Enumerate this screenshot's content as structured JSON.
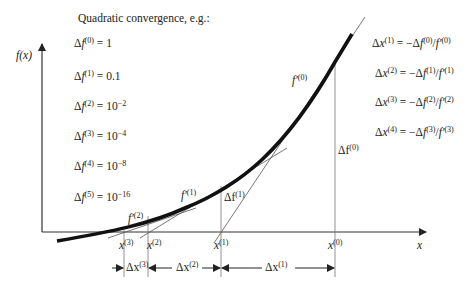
{
  "title": "Quadratic convergence, e.g.:",
  "axes": {
    "y_label": "f(x)",
    "x_label": "x"
  },
  "delta_f_values": [
    {
      "sup": "(0)",
      "value": "1"
    },
    {
      "sup": "(1)",
      "value": "0.1"
    },
    {
      "sup": "(2)",
      "value": "10",
      "exp": "−2"
    },
    {
      "sup": "(3)",
      "value": "10",
      "exp": "−4"
    },
    {
      "sup": "(4)",
      "value": "10",
      "exp": "−8"
    },
    {
      "sup": "(5)",
      "value": "10",
      "exp": "−16"
    }
  ],
  "update_formulas": [
    {
      "lhs_sup": "(1)",
      "f_sup": "(0)",
      "fp_sup": "(0)"
    },
    {
      "lhs_sup": "(2)",
      "f_sup": "(1)",
      "fp_sup": "(1)"
    },
    {
      "lhs_sup": "(3)",
      "f_sup": "(2)",
      "fp_sup": "(2)"
    },
    {
      "lhs_sup": "(4)",
      "f_sup": "(3)",
      "fp_sup": "(3)"
    }
  ],
  "iterates": [
    {
      "label": "x",
      "sup": "(0)",
      "px": 335
    },
    {
      "label": "x",
      "sup": "(1)",
      "px": 221
    },
    {
      "label": "x",
      "sup": "(2)",
      "px": 148
    },
    {
      "label": "x",
      "sup": "(3)",
      "px": 124
    }
  ],
  "derivative_labels": [
    {
      "label": "f′",
      "sup": "(0)"
    },
    {
      "label": "f′",
      "sup": "(1)"
    },
    {
      "label": "f′",
      "sup": "(2)"
    }
  ],
  "delta_f_plot_labels": [
    {
      "label": "Δf",
      "sup": "(0)"
    },
    {
      "label": "Δf",
      "sup": "(1)"
    }
  ],
  "delta_x_labels": [
    {
      "label": "Δx",
      "sup": "(1)"
    },
    {
      "label": "Δx",
      "sup": "(2)"
    },
    {
      "label": "Δx",
      "sup": "(3)"
    }
  ],
  "colors": {
    "curve": "#111111",
    "lines": "#555555",
    "text": "#222222"
  }
}
